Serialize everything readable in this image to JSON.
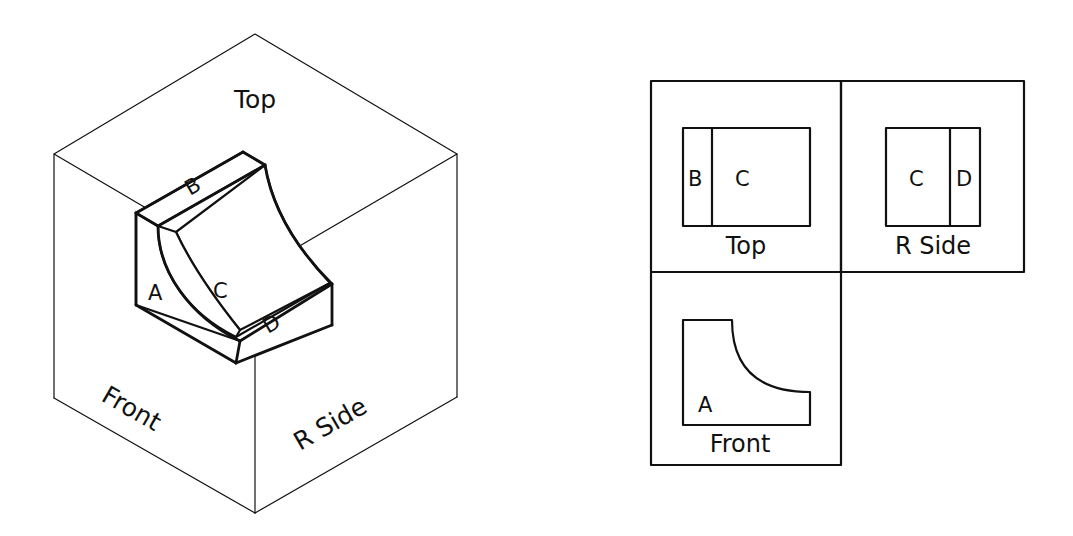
{
  "figure": {
    "title": "",
    "type": "orthographic-projection-exercise",
    "background_color": "#ffffff",
    "line_color": "#111111"
  },
  "isometric": {
    "name": "glass-box-isometric",
    "cube_labels": {
      "top": "Top",
      "front": "Front",
      "right_side": "R Side"
    },
    "surface_labels": {
      "a": "A",
      "b": "B",
      "c": "C",
      "d": "D"
    }
  },
  "ortho": {
    "views": [
      {
        "id": "top-view",
        "label": "Top",
        "surfaces": [
          "B",
          "C"
        ]
      },
      {
        "id": "rside-view",
        "label": "R Side",
        "surfaces": [
          "C",
          "D"
        ]
      },
      {
        "id": "front-view",
        "label": "Front",
        "surfaces": [
          "A"
        ]
      }
    ],
    "top_label": "Top",
    "rside_label": "R Side",
    "front_label": "Front",
    "top_surface_left": "B",
    "top_surface_right": "C",
    "rside_surface_left": "C",
    "rside_surface_right": "D",
    "front_surface": "A"
  }
}
